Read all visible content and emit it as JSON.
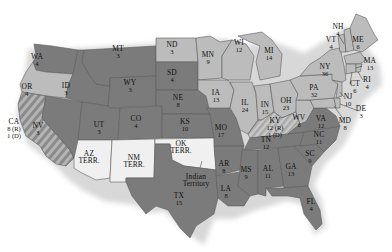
{
  "colors": {
    "dark_state": "#7b7b7b",
    "light_state": "#bcbcbc",
    "territory": "#f0f0f0",
    "split_stripe_a": "#8a8a8a",
    "split_stripe_b": "#b4b4b4",
    "border": "#5e5e5e",
    "shadow": "#d6d6d6"
  },
  "states": [
    {
      "id": "WA",
      "abbr": "WA",
      "votes": "4",
      "x": 37,
      "y": 60,
      "fill": "dark"
    },
    {
      "id": "OR",
      "abbr": "OR",
      "votes": "4",
      "x": 27,
      "y": 90,
      "fill": "light"
    },
    {
      "id": "CA",
      "abbr": "CA",
      "votes": "8 (R)",
      "votes2": "1 (D)",
      "x": 14,
      "y": 128,
      "fill": "split"
    },
    {
      "id": "NV",
      "abbr": "NV",
      "votes": "3",
      "x": 38,
      "y": 129,
      "fill": "dark"
    },
    {
      "id": "ID",
      "abbr": "ID",
      "votes": "3",
      "x": 66,
      "y": 89,
      "fill": "dark"
    },
    {
      "id": "MT",
      "abbr": "MT",
      "votes": "3",
      "x": 118,
      "y": 52,
      "fill": "dark"
    },
    {
      "id": "WY",
      "abbr": "WY",
      "votes": "3",
      "x": 130,
      "y": 86,
      "fill": "dark"
    },
    {
      "id": "UT",
      "abbr": "UT",
      "votes": "3",
      "x": 99,
      "y": 128,
      "fill": "dark"
    },
    {
      "id": "CO",
      "abbr": "CO",
      "votes": "4",
      "x": 136,
      "y": 122,
      "fill": "dark"
    },
    {
      "id": "ND",
      "abbr": "ND",
      "votes": "3",
      "x": 172,
      "y": 48,
      "fill": "light"
    },
    {
      "id": "SD",
      "abbr": "SD",
      "votes": "4",
      "x": 172,
      "y": 76,
      "fill": "dark"
    },
    {
      "id": "NE",
      "abbr": "NE",
      "votes": "8",
      "x": 178,
      "y": 101,
      "fill": "dark"
    },
    {
      "id": "KS",
      "abbr": "KS",
      "votes": "10",
      "x": 185,
      "y": 125,
      "fill": "dark"
    },
    {
      "id": "MN",
      "abbr": "MN",
      "votes": "9",
      "x": 208,
      "y": 58,
      "fill": "light"
    },
    {
      "id": "IA",
      "abbr": "IA",
      "votes": "13",
      "x": 216,
      "y": 96,
      "fill": "light"
    },
    {
      "id": "MO",
      "abbr": "MO",
      "votes": "17",
      "x": 221,
      "y": 131,
      "fill": "dark"
    },
    {
      "id": "AR",
      "abbr": "AR",
      "votes": "8",
      "x": 224,
      "y": 167,
      "fill": "dark"
    },
    {
      "id": "LA",
      "abbr": "LA",
      "votes": "8",
      "x": 226,
      "y": 192,
      "fill": "dark"
    },
    {
      "id": "TX",
      "abbr": "TX",
      "votes": "15",
      "x": 179,
      "y": 199,
      "fill": "dark"
    },
    {
      "id": "WI",
      "abbr": "WI",
      "votes": "12",
      "x": 239,
      "y": 46,
      "fill": "light"
    },
    {
      "id": "MI",
      "abbr": "MI",
      "votes": "14",
      "x": 269,
      "y": 54,
      "fill": "light"
    },
    {
      "id": "IL",
      "abbr": "IL",
      "votes": "24",
      "x": 245,
      "y": 106,
      "fill": "light"
    },
    {
      "id": "IN",
      "abbr": "IN",
      "votes": "15",
      "x": 265,
      "y": 108,
      "fill": "light"
    },
    {
      "id": "OH",
      "abbr": "OH",
      "votes": "23",
      "x": 286,
      "y": 104,
      "fill": "light"
    },
    {
      "id": "KY",
      "abbr": "KY",
      "votes": "12 (R)",
      "votes2": "1 (D)",
      "x": 275,
      "y": 127,
      "fill": "split_light"
    },
    {
      "id": "WV",
      "abbr": "WV",
      "votes": "6",
      "x": 299,
      "y": 121,
      "fill": "light"
    },
    {
      "id": "TN",
      "abbr": "TN",
      "votes": "12",
      "x": 266,
      "y": 143,
      "fill": "dark"
    },
    {
      "id": "MS",
      "abbr": "MS",
      "votes": "9",
      "x": 246,
      "y": 173,
      "fill": "dark"
    },
    {
      "id": "AL",
      "abbr": "AL",
      "votes": "11",
      "x": 268,
      "y": 172,
      "fill": "dark"
    },
    {
      "id": "GA",
      "abbr": "GA",
      "votes": "13",
      "x": 291,
      "y": 170,
      "fill": "dark"
    },
    {
      "id": "FL",
      "abbr": "FL",
      "votes": "4",
      "x": 311,
      "y": 205,
      "fill": "dark"
    },
    {
      "id": "SC",
      "abbr": "SC",
      "votes": "9",
      "x": 310,
      "y": 157,
      "fill": "dark"
    },
    {
      "id": "NC",
      "abbr": "NC",
      "votes": "11",
      "x": 319,
      "y": 138,
      "fill": "dark"
    },
    {
      "id": "VA",
      "abbr": "VA",
      "votes": "12",
      "x": 321,
      "y": 122,
      "fill": "dark"
    },
    {
      "id": "PA",
      "abbr": "PA",
      "votes": "32",
      "x": 314,
      "y": 91,
      "fill": "light"
    },
    {
      "id": "NY",
      "abbr": "NY",
      "votes": "36",
      "x": 325,
      "y": 70,
      "fill": "light"
    },
    {
      "id": "VT",
      "abbr": "VT",
      "votes": "4",
      "x": 331,
      "y": 43,
      "fill": "light"
    },
    {
      "id": "NH",
      "abbr": "NH",
      "votes": "4",
      "x": 338,
      "y": 30,
      "fill": "light"
    },
    {
      "id": "ME",
      "abbr": "ME",
      "votes": "6",
      "x": 358,
      "y": 43,
      "fill": "light"
    },
    {
      "id": "MA",
      "abbr": "MA",
      "votes": "13",
      "x": 370,
      "y": 64,
      "fill": "light"
    },
    {
      "id": "RI",
      "abbr": "RI",
      "votes": "4",
      "x": 367,
      "y": 83,
      "fill": "light"
    },
    {
      "id": "CT",
      "abbr": "CT",
      "votes": "6",
      "x": 355,
      "y": 87,
      "fill": "light"
    },
    {
      "id": "NJ",
      "abbr": "NJ",
      "votes": "10",
      "x": 348,
      "y": 100,
      "fill": "light"
    },
    {
      "id": "DE",
      "abbr": "DE",
      "votes": "3",
      "x": 361,
      "y": 112,
      "fill": "light"
    },
    {
      "id": "MD",
      "abbr": "MD",
      "votes": "8",
      "x": 345,
      "y": 124,
      "fill": "light"
    }
  ],
  "territories": [
    {
      "id": "AZ",
      "line1": "AZ",
      "line2": "TERR.",
      "x": 89,
      "y": 157
    },
    {
      "id": "NM",
      "line1": "NM",
      "line2": "TERR.",
      "x": 134,
      "y": 161
    },
    {
      "id": "OK",
      "line1": "OK",
      "line2": "TERR.",
      "x": 181,
      "y": 147
    }
  ],
  "annotations": [
    {
      "id": "indian-territory",
      "line1": "Indian",
      "line2": "Territory",
      "x": 196,
      "y": 180
    }
  ]
}
